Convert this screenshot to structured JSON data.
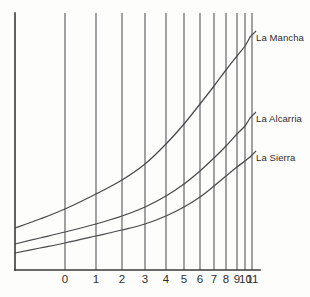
{
  "chart_data": {
    "type": "line",
    "title": "",
    "xlabel": "",
    "ylabel": "",
    "grid": "vertical",
    "legend_position": "right-inline-labels",
    "axis": {
      "x_min_px": 15,
      "x_max_px": 260,
      "y_top_px": 13,
      "y_baseline_px": 270
    },
    "x_tick_labels": [
      "0",
      "1",
      "2",
      "3",
      "4",
      "5",
      "6",
      "7",
      "8",
      "9",
      "10",
      "11"
    ],
    "x_tick_px": [
      65,
      96,
      122,
      145,
      166,
      184,
      200,
      214,
      226,
      237,
      245,
      252
    ],
    "x_tick_label_px": [
      65,
      96,
      122,
      145,
      166,
      184,
      200,
      214,
      226,
      237,
      245.5,
      252.5
    ],
    "series": [
      {
        "name": "La Mancha",
        "label": "La Mancha",
        "label_px": {
          "x": 256,
          "y": 33
        },
        "leader": [
          [
            250,
            37
          ],
          [
            256,
            31
          ]
        ],
        "points_px": [
          [
            15,
            228
          ],
          [
            40,
            219
          ],
          [
            65,
            209
          ],
          [
            96,
            194
          ],
          [
            122,
            180
          ],
          [
            145,
            164
          ],
          [
            166,
            144
          ],
          [
            184,
            124
          ],
          [
            200,
            104
          ],
          [
            214,
            86
          ],
          [
            226,
            70
          ],
          [
            237,
            56
          ],
          [
            245,
            46
          ],
          [
            250,
            37
          ]
        ]
      },
      {
        "name": "La Alcarria",
        "label": "La Alcarria",
        "label_px": {
          "x": 256,
          "y": 114
        },
        "leader": [
          [
            250,
            118
          ],
          [
            256,
            112
          ]
        ],
        "points_px": [
          [
            15,
            244
          ],
          [
            40,
            238
          ],
          [
            65,
            232
          ],
          [
            96,
            224
          ],
          [
            122,
            216
          ],
          [
            145,
            207
          ],
          [
            166,
            196
          ],
          [
            184,
            184
          ],
          [
            200,
            171
          ],
          [
            214,
            158
          ],
          [
            226,
            146
          ],
          [
            237,
            134
          ],
          [
            245,
            126
          ],
          [
            250,
            118
          ]
        ]
      },
      {
        "name": "La Sierra",
        "label": "La Sierra",
        "label_px": {
          "x": 256,
          "y": 153
        },
        "leader": [
          [
            250,
            157
          ],
          [
            256,
            151
          ]
        ],
        "points_px": [
          [
            15,
            253
          ],
          [
            40,
            248
          ],
          [
            65,
            243
          ],
          [
            96,
            236
          ],
          [
            122,
            230
          ],
          [
            145,
            224
          ],
          [
            166,
            216
          ],
          [
            184,
            207
          ],
          [
            200,
            197
          ],
          [
            214,
            186
          ],
          [
            226,
            176
          ],
          [
            237,
            167
          ],
          [
            245,
            161
          ],
          [
            250,
            157
          ]
        ]
      }
    ]
  }
}
